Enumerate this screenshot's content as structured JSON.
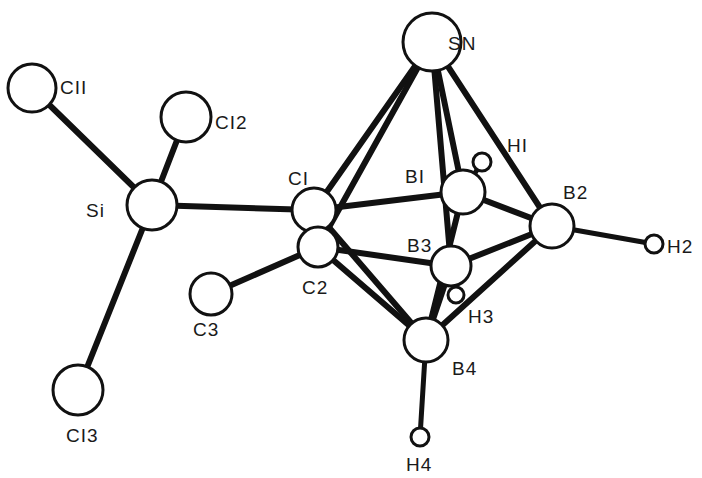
{
  "diagram": {
    "title": "",
    "atoms": [
      {
        "id": "Sn",
        "label": "SN",
        "x": 432,
        "y": 42,
        "r": 29,
        "lx": 448,
        "ly": 50
      },
      {
        "id": "Cl1",
        "label": "CII",
        "x": 32,
        "y": 88,
        "r": 24,
        "lx": 60,
        "ly": 94
      },
      {
        "id": "Cl2",
        "label": "CI2",
        "x": 186,
        "y": 117,
        "r": 25,
        "lx": 215,
        "ly": 129
      },
      {
        "id": "Si",
        "label": "Si",
        "x": 152,
        "y": 205,
        "r": 25,
        "lx": 86,
        "ly": 217
      },
      {
        "id": "C1",
        "label": "CI",
        "x": 314,
        "y": 210,
        "r": 22,
        "lx": 288,
        "ly": 185
      },
      {
        "id": "B1",
        "label": "BI",
        "x": 463,
        "y": 192,
        "r": 22,
        "lx": 405,
        "ly": 183
      },
      {
        "id": "H1",
        "label": "HI",
        "x": 482,
        "y": 162,
        "r": 9,
        "lx": 507,
        "ly": 152
      },
      {
        "id": "B2",
        "label": "B2",
        "x": 552,
        "y": 226,
        "r": 22,
        "lx": 563,
        "ly": 199
      },
      {
        "id": "H2",
        "label": "H2",
        "x": 654,
        "y": 244,
        "r": 9,
        "lx": 667,
        "ly": 253
      },
      {
        "id": "C2",
        "label": "C2",
        "x": 318,
        "y": 247,
        "r": 20,
        "lx": 302,
        "ly": 294
      },
      {
        "id": "B3",
        "label": "B3",
        "x": 451,
        "y": 266,
        "r": 20,
        "lx": 407,
        "ly": 252
      },
      {
        "id": "H3",
        "label": "H3",
        "x": 456,
        "y": 295,
        "r": 8,
        "lx": 468,
        "ly": 323
      },
      {
        "id": "C3",
        "label": "C3",
        "x": 211,
        "y": 294,
        "r": 21,
        "lx": 193,
        "ly": 336
      },
      {
        "id": "B4",
        "label": "B4",
        "x": 426,
        "y": 340,
        "r": 22,
        "lx": 452,
        "ly": 375
      },
      {
        "id": "H4",
        "label": "H4",
        "x": 420,
        "y": 437,
        "r": 9,
        "lx": 406,
        "ly": 471
      },
      {
        "id": "Cl3",
        "label": "CI3",
        "x": 78,
        "y": 390,
        "r": 25,
        "lx": 66,
        "ly": 442
      }
    ],
    "bonds": [
      [
        "Cl1",
        "Si"
      ],
      [
        "Cl2",
        "Si"
      ],
      [
        "Si",
        "Cl3"
      ],
      [
        "Si",
        "C1"
      ],
      [
        "Sn",
        "C1"
      ],
      [
        "Sn",
        "C2"
      ],
      [
        "Sn",
        "B1"
      ],
      [
        "Sn",
        "B3"
      ],
      [
        "Sn",
        "B2"
      ],
      [
        "C1",
        "B1"
      ],
      [
        "C1",
        "C2"
      ],
      [
        "C1",
        "B4"
      ],
      [
        "C2",
        "B3"
      ],
      [
        "C2",
        "B4"
      ],
      [
        "C2",
        "C3"
      ],
      [
        "B1",
        "H1"
      ],
      [
        "B1",
        "B2"
      ],
      [
        "B1",
        "B4"
      ],
      [
        "B2",
        "B3"
      ],
      [
        "B2",
        "B4"
      ],
      [
        "B2",
        "H2"
      ],
      [
        "B3",
        "B4"
      ],
      [
        "B3",
        "H3"
      ],
      [
        "B4",
        "H4"
      ]
    ]
  }
}
